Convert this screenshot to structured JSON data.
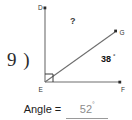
{
  "problem": {
    "number_label": "9 )"
  },
  "figure": {
    "vertices": {
      "d": {
        "label": "D",
        "x": 45,
        "y": 8
      },
      "e": {
        "label": "E",
        "x": 45,
        "y": 82
      },
      "f": {
        "label": "F",
        "x": 120,
        "y": 82
      },
      "g": {
        "label": "G",
        "x": 116,
        "y": 31
      }
    },
    "rays": [
      {
        "name": "ray-ed",
        "from": "E",
        "to": "D"
      },
      {
        "name": "ray-ef",
        "from": "E",
        "to": "F"
      },
      {
        "name": "ray-eg",
        "from": "E",
        "to": "G"
      }
    ],
    "right_angle_marker": {
      "at": "E",
      "present": true
    },
    "angles": {
      "unknown": {
        "label": "?",
        "name": "angle-DEG"
      },
      "known": {
        "value": "38",
        "degree_symbol": "°",
        "name": "angle-GEF"
      }
    },
    "line_color": "#6e6e6e",
    "label_color": "#333333"
  },
  "answer": {
    "label": "Angle = ",
    "value": "52",
    "degree_symbol": "°",
    "value_color": "#8c8c8c"
  }
}
